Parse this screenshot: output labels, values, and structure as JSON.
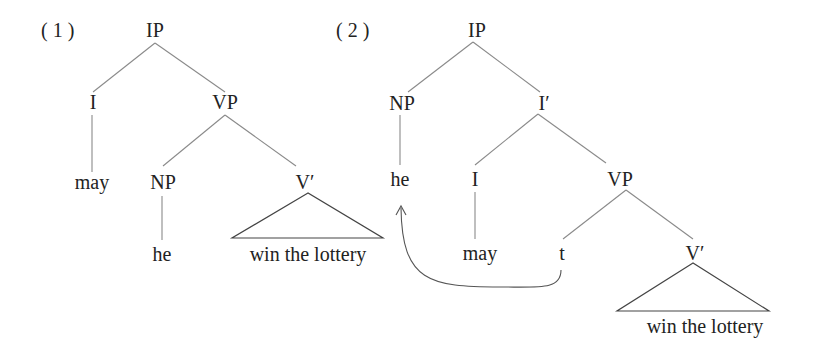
{
  "diagram": {
    "type": "syntax-trees",
    "trees": [
      {
        "number": "( 1 )",
        "nodes": {
          "root": "IP",
          "i": "I",
          "vp": "VP",
          "may": "may",
          "np": "NP",
          "vbar": "V′",
          "he": "he",
          "triangle_text": "win the lottery"
        }
      },
      {
        "number": "( 2 )",
        "nodes": {
          "root": "IP",
          "np": "NP",
          "ibar": "I′",
          "he": "he",
          "i": "I",
          "vp": "VP",
          "may": "may",
          "trace": "t",
          "vbar": "V′",
          "triangle_text": "win the lottery"
        },
        "movement": {
          "from": "t",
          "to": "he"
        }
      }
    ]
  },
  "colors": {
    "text": "#222222",
    "edges": "#8a8a8a",
    "triangle": "#444444",
    "arrow": "#555555"
  }
}
